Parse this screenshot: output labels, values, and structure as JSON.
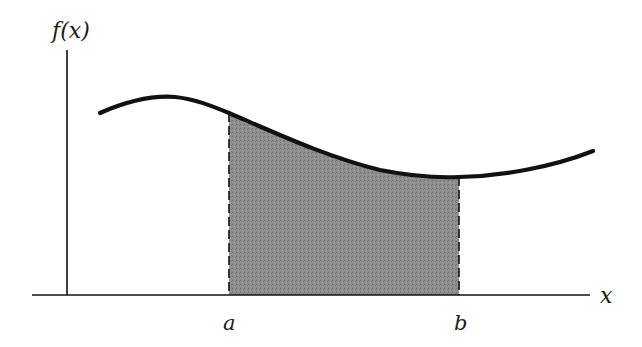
{
  "diagram": {
    "y_axis_label": "f(x)",
    "x_axis_label": "x",
    "bounds": {
      "lower": "a",
      "upper": "b"
    },
    "shaded_region": "area under f(x) from a to b",
    "colors": {
      "curve": "#111111",
      "axis": "#111111",
      "fill": "#8c8c8c",
      "background": "#ffffff"
    }
  }
}
